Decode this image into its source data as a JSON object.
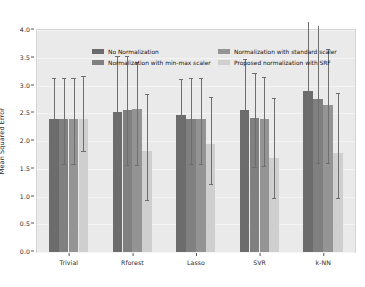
{
  "chart_data": {
    "type": "bar",
    "title": "",
    "subtitle": "",
    "xlabel": "",
    "ylabel": "Mean Squared Error",
    "categories": [
      "Trivial",
      "Rforest",
      "Lasso",
      "SVR",
      "k-NN"
    ],
    "ylim": [
      0.0,
      4.0
    ],
    "yticks": [
      "0.0",
      "0.5",
      "1.0",
      "1.5",
      "2.0",
      "2.5",
      "3.0",
      "3.5",
      "4.0"
    ],
    "ytick_values": [
      0.0,
      0.5,
      1.0,
      1.5,
      2.0,
      2.5,
      3.0,
      3.5,
      4.0
    ],
    "grid": true,
    "grid_axis": "y",
    "legend_position": "upper-center",
    "error_bars": true,
    "plot_background": "#eaeaea",
    "figure_background": "#ffffff",
    "series": [
      {
        "name": "No Normalization",
        "color": "#6c6c6c",
        "values": [
          2.4,
          2.53,
          2.47,
          2.55,
          2.9
        ],
        "err_low": [
          0.82,
          0.95,
          0.88,
          0.98,
          1.22
        ],
        "err_high": [
          0.73,
          1.0,
          0.65,
          0.92,
          1.25
        ]
      },
      {
        "name": "Normalization with min-max scaler",
        "color": "#808080",
        "values": [
          2.4,
          2.55,
          2.4,
          2.42,
          2.76
        ],
        "err_low": [
          0.82,
          0.98,
          0.82,
          0.88,
          1.16
        ],
        "err_high": [
          0.73,
          0.98,
          0.73,
          0.8,
          1.32
        ]
      },
      {
        "name": "Normalization with standard scaler",
        "color": "#949494",
        "values": [
          2.4,
          2.57,
          2.4,
          2.4,
          2.65
        ],
        "err_low": [
          0.82,
          1.0,
          0.82,
          0.85,
          1.05
        ],
        "err_high": [
          0.73,
          0.85,
          0.73,
          0.75,
          1.0
        ]
      },
      {
        "name": "Proposed normalization with SRF",
        "color": "#cfcfcf",
        "values": [
          2.4,
          1.82,
          1.95,
          1.7,
          1.78
        ],
        "err_low": [
          0.58,
          0.88,
          0.72,
          0.72,
          0.8
        ],
        "err_high": [
          0.77,
          1.02,
          0.85,
          1.08,
          1.08
        ]
      }
    ]
  },
  "legend": {
    "items": [
      {
        "label": "No Normalization",
        "color": "#6c6c6c"
      },
      {
        "label": "Normalization with standard scaler",
        "color": "#949494"
      },
      {
        "label": "Normalization with min-max scaler",
        "color": "#808080"
      },
      {
        "label": "Proposed normalization with SRF",
        "color": "#cfcfcf"
      }
    ]
  }
}
